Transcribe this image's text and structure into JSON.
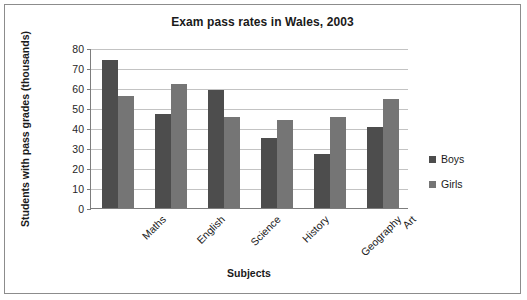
{
  "chart_data": {
    "type": "bar",
    "title": "Exam pass rates in Wales, 2003",
    "xlabel": "Subjects",
    "ylabel": "Students with pass grades (thousands)",
    "categories": [
      "Maths",
      "English",
      "Science",
      "History",
      "Geography",
      "Art"
    ],
    "series": [
      {
        "name": "Boys",
        "color": "#4d4d4d",
        "values": [
          74,
          47,
          59,
          35,
          27,
          40.5
        ]
      },
      {
        "name": "Girls",
        "color": "#757575",
        "values": [
          56,
          62,
          45.5,
          44,
          45.5,
          54.5
        ]
      }
    ],
    "ylim": [
      0,
      80
    ],
    "ytick_step": 10,
    "ytick_labels": [
      "80",
      "70",
      "60",
      "50",
      "40",
      "30",
      "20",
      "10",
      "0"
    ],
    "grid": true,
    "legend_position": "right",
    "xtick_rotation": -45
  }
}
